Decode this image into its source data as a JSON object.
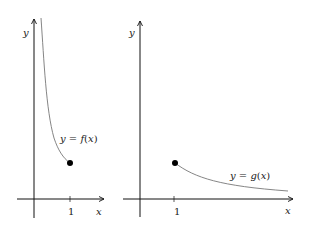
{
  "diagram": {
    "panels": [
      {
        "id": "left",
        "function_label": "y = f(x)",
        "label_parts": {
          "lhs": "y",
          "eq": " = ",
          "fn": "f",
          "open": "(",
          "arg": "x",
          "close": ")"
        },
        "x_axis_label": "x",
        "y_axis_label": "y",
        "tick_label": "1",
        "endpoint": "closed dot at x = 1",
        "behavior": "decreasing curve, steep near y-axis, ending at (1, f(1))"
      },
      {
        "id": "right",
        "function_label": "y = g(x)",
        "label_parts": {
          "lhs": "y",
          "eq": " = ",
          "fn": "g",
          "open": "(",
          "arg": "x",
          "close": ")"
        },
        "x_axis_label": "x",
        "y_axis_label": "y",
        "tick_label": "1",
        "endpoint": "closed dot at x = 1",
        "behavior": "decreasing curve starting at (1, g(1)) approaching x-axis"
      }
    ],
    "colors": {
      "axis": "#111111",
      "curve": "#777777",
      "dot": "#000000"
    }
  }
}
